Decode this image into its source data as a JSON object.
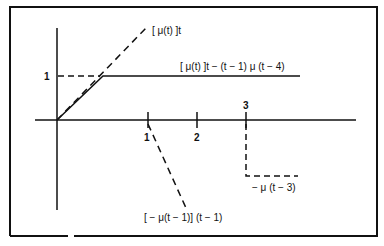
{
  "diagram": {
    "type": "signal-decomposition",
    "colors": {
      "ink": "#111111",
      "background": "#ffffff"
    },
    "axes": {
      "x_ticks": [
        {
          "label": "1",
          "value": 1
        },
        {
          "label": "2",
          "value": 2
        },
        {
          "label": "3",
          "value": 3
        }
      ],
      "y_ticks": [
        {
          "label": "1",
          "value": 1
        }
      ]
    },
    "labels": {
      "ramp": "[ μ(t) ]t",
      "result": "[ μ(t) ]t − (t − 1) μ (t − 4)",
      "negative_ramp": "[ − μ(t − 1)] (t − 1)",
      "negative_step": "− μ (t − 3)"
    },
    "curves": [
      {
        "name": "ramp",
        "style": "dashed",
        "from": [
          0,
          0
        ],
        "to": [
          1.8,
          1.8
        ]
      },
      {
        "name": "result",
        "style": "solid",
        "points": [
          [
            0,
            0
          ],
          [
            1,
            1
          ],
          [
            5,
            1
          ]
        ]
      },
      {
        "name": "negative_ramp",
        "style": "dashed",
        "from": [
          1,
          0
        ],
        "to": [
          2.3,
          -2.5
        ]
      },
      {
        "name": "negative_step",
        "style": "dashed",
        "points": [
          [
            3,
            0
          ],
          [
            3,
            -1
          ],
          [
            4,
            -1
          ]
        ]
      },
      {
        "name": "y1_guide",
        "style": "dashed",
        "from": [
          0,
          1
        ],
        "to": [
          1,
          1
        ]
      }
    ]
  }
}
